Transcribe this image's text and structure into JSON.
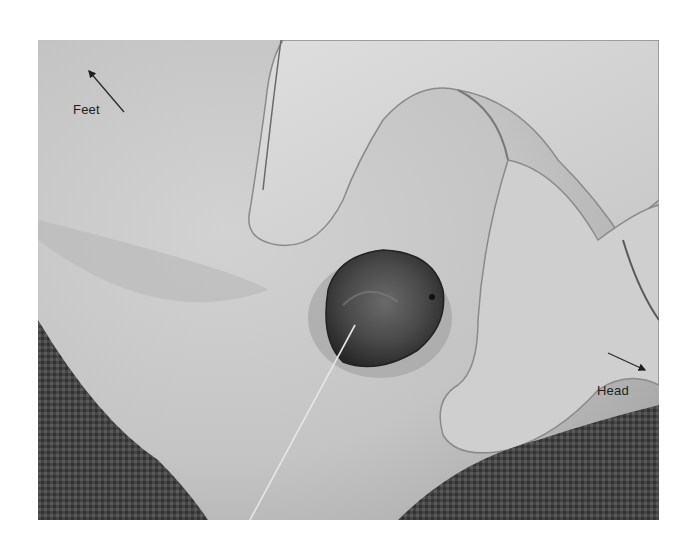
{
  "figure": {
    "type": "clinical-photograph",
    "colormode": "grayscale",
    "annotations": [
      {
        "id": "feet",
        "text": "Feet",
        "arrow_direction": "up-left"
      },
      {
        "id": "head",
        "text": "Head",
        "arrow_direction": "down-right"
      }
    ]
  },
  "colors": {
    "background": "#ffffff",
    "skin": "#c9c9c9",
    "glove": "#d6d6d6",
    "lesion": "#3a3a3a",
    "cloth": "#3c3c3c",
    "text": "#1e1e1e"
  }
}
